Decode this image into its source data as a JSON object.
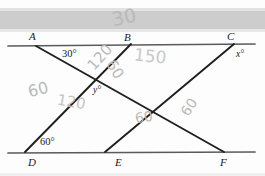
{
  "document": {
    "kind": "scanned-worksheet-figure",
    "description": "Geometry figure with two parallel horizontal lines and three transversals"
  },
  "scan": {
    "top_band_color": "#cdcdcd",
    "paper_color": "#fdfdfd",
    "ink_color": "#1a1a1a",
    "pencil_color": "#b9b9b9"
  },
  "figure": {
    "points": [
      {
        "name": "A",
        "label": "A",
        "x": 33,
        "y": 38
      },
      {
        "name": "B",
        "label": "B",
        "x": 128,
        "y": 39
      },
      {
        "name": "C",
        "label": "C",
        "x": 231,
        "y": 38
      },
      {
        "name": "D",
        "label": "D",
        "x": 32,
        "y": 164
      },
      {
        "name": "E",
        "label": "E",
        "x": 119,
        "y": 164
      },
      {
        "name": "F",
        "label": "F",
        "x": 224,
        "y": 164
      }
    ],
    "angles": [
      {
        "name": "angle-at-A",
        "label": "30°",
        "x": 62,
        "y": 55
      },
      {
        "name": "angle-at-D",
        "label": "60°",
        "x": 40,
        "y": 143
      },
      {
        "name": "angle-at-C",
        "label": "x°",
        "x": 236,
        "y": 55
      },
      {
        "name": "angle-at-center",
        "label": "y°",
        "x": 93,
        "y": 91
      }
    ],
    "lines": [
      {
        "name": "top-parallel-line",
        "x1": 8,
        "y1": 46,
        "x2": 255,
        "y2": 44
      },
      {
        "name": "bottom-parallel-line",
        "x1": 8,
        "y1": 153,
        "x2": 255,
        "y2": 152
      },
      {
        "name": "transversal-A-to-F",
        "x1": 36,
        "y1": 46,
        "x2": 224,
        "y2": 152
      },
      {
        "name": "transversal-B-to-D",
        "x1": 131,
        "y1": 45,
        "x2": 25,
        "y2": 152
      },
      {
        "name": "transversal-C-to-E",
        "x1": 234,
        "y1": 44,
        "x2": 105,
        "y2": 152
      }
    ]
  },
  "handwriting": [
    {
      "name": "pencil-note-top-30",
      "text": "30",
      "x": 112,
      "y": 8,
      "size": 19,
      "rotate": -12
    },
    {
      "name": "pencil-note-120-upper",
      "text": "120",
      "x": 86,
      "y": 50,
      "size": 15,
      "rotate": -48
    },
    {
      "name": "pencil-note-150",
      "text": "150",
      "x": 134,
      "y": 48,
      "size": 17,
      "rotate": 6
    },
    {
      "name": "pencil-note-60-left",
      "text": "60",
      "x": 28,
      "y": 82,
      "size": 16,
      "rotate": -14
    },
    {
      "name": "pencil-note-60-upper-right",
      "text": "60",
      "x": 105,
      "y": 62,
      "size": 15,
      "rotate": 58
    },
    {
      "name": "pencil-note-120-lower",
      "text": "120",
      "x": 57,
      "y": 95,
      "size": 15,
      "rotate": 10
    },
    {
      "name": "pencil-note-60-lower-left",
      "text": "60",
      "x": 135,
      "y": 110,
      "size": 14,
      "rotate": -8
    },
    {
      "name": "pencil-note-60-lower-right",
      "text": "60",
      "x": 180,
      "y": 100,
      "size": 14,
      "rotate": -55
    }
  ]
}
